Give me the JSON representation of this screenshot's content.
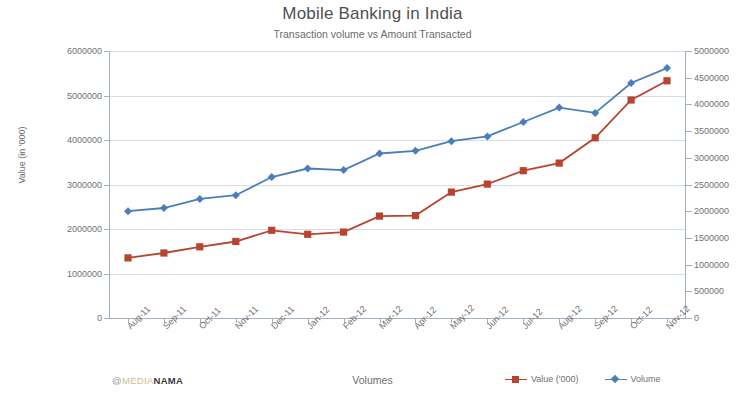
{
  "chart_data": {
    "type": "line",
    "title": "Mobile Banking in India",
    "subtitle": "Transaction volume vs Amount Transacted",
    "xlabel": "Volumes",
    "ylabel": "Value (in '000)",
    "y2label": "",
    "grid": true,
    "legend_position": "bottom-right",
    "categories": [
      "Aug-11",
      "Sep-11",
      "Oct-11",
      "Nov-11",
      "Dec-11",
      "Jan-12",
      "Feb-12",
      "Mar-12",
      "Apr-12",
      "May-12",
      "Jun-12",
      "Jul-12",
      "Aug-12",
      "Sep-12",
      "Oct-12",
      "Nov-12"
    ],
    "ylim": [
      0,
      6000000
    ],
    "y2lim": [
      0,
      5000000
    ],
    "yticks": [
      "0",
      "1000000",
      "2000000",
      "3000000",
      "4000000",
      "5000000",
      "6000000"
    ],
    "y2ticks": [
      "0",
      "500000",
      "1000000",
      "1500000",
      "2000000",
      "2500000",
      "3000000",
      "3500000",
      "4000000",
      "4500000",
      "5000000"
    ],
    "series": [
      {
        "name": "Value ('000)",
        "axis": "left",
        "color": "#b8432f",
        "marker": "square",
        "values": [
          1350000,
          1460000,
          1600000,
          1720000,
          1970000,
          1880000,
          1930000,
          2290000,
          2300000,
          2830000,
          3010000,
          3310000,
          3480000,
          4050000,
          4900000,
          5330000
        ]
      },
      {
        "name": "Volume",
        "axis": "right",
        "color": "#4a7ebb",
        "marker": "diamond",
        "values": [
          2000000,
          2060000,
          2230000,
          2300000,
          2640000,
          2800000,
          2770000,
          3080000,
          3130000,
          3310000,
          3400000,
          3670000,
          3940000,
          3840000,
          4400000,
          4680000
        ]
      }
    ]
  },
  "watermark": {
    "at": "@",
    "light": "MEDIA",
    "bold": "NAMA"
  }
}
